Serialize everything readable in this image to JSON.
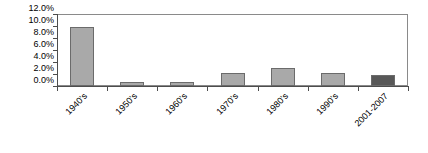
{
  "chart_data": {
    "type": "bar",
    "title": "",
    "subtitle": "",
    "xlabel": "",
    "ylabel": "",
    "categories": [
      "1940's",
      "1950's",
      "1960's",
      "1970's",
      "1980's",
      "1990's",
      "2001-2007"
    ],
    "values": [
      9.8,
      0.6,
      0.6,
      2.1,
      3.0,
      2.2,
      1.9
    ],
    "value_labels": [
      "9.8%",
      "0.6%",
      "0.6%",
      "2.1%",
      "3.0%",
      "2.2%",
      "1.9%"
    ],
    "ylim": [
      0.0,
      12.0
    ],
    "ytick_values": [
      0.0,
      2.0,
      4.0,
      6.0,
      8.0,
      10.0,
      12.0
    ],
    "ytick_labels": [
      "0.0%",
      "2.0%",
      "4.0%",
      "6.0%",
      "8.0%",
      "10.0%",
      "12.0%"
    ],
    "grid": false,
    "legend": false,
    "legend_position": "none",
    "bar_colors": [
      "#a9a9a9",
      "#a9a9a9",
      "#a9a9a9",
      "#a9a9a9",
      "#a9a9a9",
      "#a9a9a9",
      "#585858"
    ],
    "bar_border_color": "#6b6b6b",
    "axis_color": "#4d4d4d",
    "frame_color": "#8a8a8a",
    "background_color": "#ffffff",
    "xtick_label_rotation": -45
  }
}
